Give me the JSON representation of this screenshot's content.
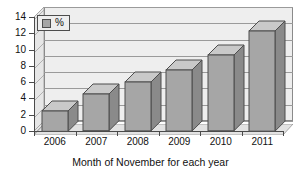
{
  "chart_data": {
    "type": "bar",
    "title": "",
    "subtitle": "",
    "xlabel": "Month of November for each year",
    "ylabel": "",
    "categories": [
      "2006",
      "2007",
      "2008",
      "2009",
      "2010",
      "2011"
    ],
    "series": [
      {
        "name": "%",
        "values": [
          2.5,
          4.5,
          6.0,
          7.5,
          9.3,
          12.3
        ]
      }
    ],
    "ylim": [
      0,
      14
    ],
    "ytick_step": 2,
    "yticks": [
      "0",
      "2",
      "4",
      "6",
      "8",
      "10",
      "12",
      "14"
    ],
    "grid": true,
    "grid_axis": "y",
    "legend": {
      "position": "top-left",
      "entries": [
        "%"
      ]
    },
    "style": {
      "bar_face_color": "#a6a6a6",
      "bar_top_color": "#c9c9c9",
      "bar_side_color": "#8a8a8a",
      "bar_edge_color": "#4d4d4d",
      "plot_background": "#eeeeee",
      "gridline_color": "#9a9a9a",
      "axis_color": "#4a4a4a",
      "text_color": "#111111",
      "three_d": true
    }
  }
}
